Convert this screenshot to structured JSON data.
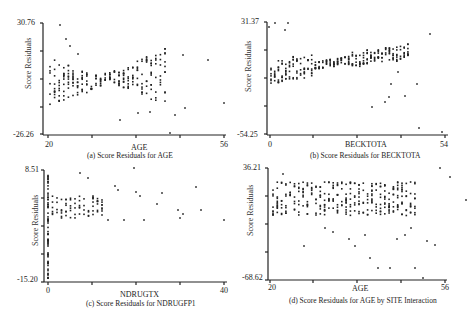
{
  "chart_data": [
    {
      "type": "scatter",
      "id": "a",
      "caption": "(a) Score Residuals for AGE",
      "xlabel": "AGE",
      "ylabel": "Score Residuals",
      "xlim": [
        20,
        56
      ],
      "ylim": [
        -26.26,
        30.76
      ],
      "x_tick_labels": [
        "20",
        "56"
      ],
      "y_tick_labels": [
        "30.76",
        "-26.26"
      ],
      "grid": false,
      "description": "Funnel pattern: wide spread at low ages (20-27), narrow near 31-33, widening again to ~44; outliers at x~53 (y~6), x~56 (y~-10)"
    },
    {
      "type": "scatter",
      "id": "b",
      "caption": "(b) Score Residuals for BECKTOTA",
      "xlabel": "BECKTOTA",
      "ylabel": "Score Residuals",
      "xlim": [
        0,
        54
      ],
      "ylim": [
        -54.25,
        31.37
      ],
      "x_tick_labels": [
        "0",
        "54"
      ],
      "y_tick_labels": [
        "31.37",
        "-54.25"
      ],
      "grid": false,
      "description": "Upward trending band from ~-5 at x=0 to ~15 at x=40, with negative outliers near x=35-48 and extreme outliers at x~47 (y~-45) and x~53 (y~-53)"
    },
    {
      "type": "scatter",
      "id": "c",
      "caption": "(c) Score Residuals for NDRUGFP1",
      "xlabel": "NDRUGTX",
      "ylabel": "Score Residuals",
      "xlim": [
        0,
        40
      ],
      "ylim": [
        -15.2,
        8.51
      ],
      "x_tick_labels": [
        "0",
        "40"
      ],
      "y_tick_labels": [
        "8.51",
        "-15.20"
      ],
      "grid": false,
      "description": "Dense vertical stripe at x=0 spanning -15 to 7; columns at integer x values between 1 and 12 spanning about -1 to 6; sparse points to x=40"
    },
    {
      "type": "scatter",
      "id": "d",
      "caption": "(d) Score Residuals for AGE by SITE Interaction",
      "xlabel": "AGE",
      "ylabel": "Score Residuals",
      "xlim": [
        20,
        56
      ],
      "ylim": [
        -68.62,
        36.21
      ],
      "x_tick_labels": [
        "20",
        "56"
      ],
      "y_tick_labels": [
        "36.21",
        "-68.62"
      ],
      "grid": false,
      "description": "Dense band between about -5 and 25 across ages 21-50, scattered negative outliers down to -68 between ages 29-48"
    }
  ],
  "panels": {
    "a": {
      "ymax": "30.76",
      "ymin": "-26.26",
      "xmin": "20",
      "xmax": "56",
      "xlabel": "AGE",
      "ylabel": "Score Residuals",
      "caption": "(a) Score Residuals for AGE"
    },
    "b": {
      "ymax": "31.37",
      "ymin": "-54.25",
      "xmin": "0",
      "xmax": "54",
      "xlabel": "BECKTOTA",
      "ylabel": "Score Residuals",
      "caption": "(b) Score Residuals for BECKTOTA"
    },
    "c": {
      "ymax": "8.51",
      "ymin": "-15.20",
      "xmin": "0",
      "xmax": "40",
      "xlabel": "NDRUGTX",
      "ylabel": "Score Residuals",
      "caption": "(c) Score Residuals for NDRUGFP1"
    },
    "d": {
      "ymax": "36.21",
      "ymin": "-68.62",
      "xmin": "20",
      "xmax": "56",
      "xlabel": "AGE",
      "ylabel": "Score Residuals",
      "caption": "(d) Score Residuals for AGE by SITE Interaction"
    }
  }
}
